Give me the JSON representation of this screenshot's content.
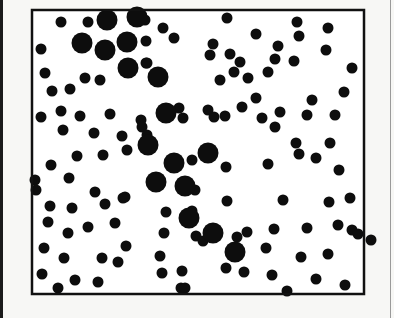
{
  "figure": {
    "frame": {
      "x": 32,
      "y": 10,
      "width": 332,
      "height": 284,
      "stroke": "#111111",
      "stroke_width": 2.5
    },
    "dot_color": "#0d0d0d",
    "background": "#ffffff",
    "small_radius": 5.5,
    "large_radius": 10.5,
    "small_dots": [
      [
        61,
        22
      ],
      [
        88,
        22
      ],
      [
        145,
        20
      ],
      [
        163,
        28
      ],
      [
        227,
        18
      ],
      [
        297,
        22
      ],
      [
        328,
        28
      ],
      [
        41,
        49
      ],
      [
        146,
        41
      ],
      [
        174,
        38
      ],
      [
        213,
        44
      ],
      [
        256,
        34
      ],
      [
        278,
        46
      ],
      [
        299,
        36
      ],
      [
        230,
        54
      ],
      [
        45,
        73
      ],
      [
        85,
        78
      ],
      [
        100,
        80
      ],
      [
        146,
        63
      ],
      [
        210,
        55
      ],
      [
        240,
        62
      ],
      [
        268,
        72
      ],
      [
        294,
        61
      ],
      [
        326,
        50
      ],
      [
        352,
        68
      ],
      [
        52,
        91
      ],
      [
        70,
        89
      ],
      [
        147,
        63
      ],
      [
        234,
        72
      ],
      [
        248,
        78
      ],
      [
        275,
        59
      ],
      [
        220,
        80
      ],
      [
        41,
        117
      ],
      [
        61,
        111
      ],
      [
        80,
        116
      ],
      [
        110,
        114
      ],
      [
        141,
        120
      ],
      [
        179,
        108
      ],
      [
        208,
        110
      ],
      [
        225,
        116
      ],
      [
        256,
        98
      ],
      [
        262,
        118
      ],
      [
        280,
        112
      ],
      [
        312,
        100
      ],
      [
        344,
        92
      ],
      [
        63,
        130
      ],
      [
        94,
        133
      ],
      [
        122,
        136
      ],
      [
        142,
        127
      ],
      [
        183,
        118
      ],
      [
        214,
        117
      ],
      [
        242,
        107
      ],
      [
        275,
        127
      ],
      [
        307,
        115
      ],
      [
        335,
        115
      ],
      [
        77,
        156
      ],
      [
        103,
        155
      ],
      [
        127,
        150
      ],
      [
        147,
        135
      ],
      [
        192,
        160
      ],
      [
        206,
        153
      ],
      [
        296,
        143
      ],
      [
        316,
        158
      ],
      [
        330,
        143
      ],
      [
        51,
        165
      ],
      [
        69,
        178
      ],
      [
        95,
        192
      ],
      [
        125,
        197
      ],
      [
        160,
        184
      ],
      [
        195,
        190
      ],
      [
        226,
        167
      ],
      [
        268,
        164
      ],
      [
        299,
        154
      ],
      [
        339,
        170
      ],
      [
        50,
        206
      ],
      [
        72,
        208
      ],
      [
        105,
        204
      ],
      [
        123,
        198
      ],
      [
        166,
        212
      ],
      [
        192,
        211
      ],
      [
        227,
        201
      ],
      [
        283,
        200
      ],
      [
        329,
        202
      ],
      [
        350,
        198
      ],
      [
        48,
        222
      ],
      [
        68,
        233
      ],
      [
        88,
        227
      ],
      [
        115,
        223
      ],
      [
        164,
        233
      ],
      [
        196,
        236
      ],
      [
        247,
        232
      ],
      [
        274,
        229
      ],
      [
        307,
        228
      ],
      [
        338,
        225
      ],
      [
        352,
        230
      ],
      [
        44,
        248
      ],
      [
        64,
        258
      ],
      [
        102,
        258
      ],
      [
        126,
        246
      ],
      [
        160,
        256
      ],
      [
        203,
        241
      ],
      [
        237,
        237
      ],
      [
        266,
        248
      ],
      [
        301,
        257
      ],
      [
        328,
        254
      ],
      [
        42,
        274
      ],
      [
        75,
        280
      ],
      [
        98,
        282
      ],
      [
        118,
        262
      ],
      [
        162,
        273
      ],
      [
        182,
        271
      ],
      [
        226,
        268
      ],
      [
        244,
        272
      ],
      [
        272,
        275
      ],
      [
        316,
        279
      ],
      [
        345,
        285
      ],
      [
        358,
        234
      ],
      [
        58,
        288
      ],
      [
        181,
        288
      ],
      [
        185,
        288
      ],
      [
        287,
        291
      ],
      [
        371,
        240
      ],
      [
        35,
        180
      ],
      [
        36,
        190
      ]
    ],
    "large_dots": [
      [
        107,
        20
      ],
      [
        137,
        17
      ],
      [
        82,
        43
      ],
      [
        105,
        50
      ],
      [
        127,
        42
      ],
      [
        128,
        68
      ],
      [
        158,
        77
      ],
      [
        166,
        113
      ],
      [
        148,
        145
      ],
      [
        208,
        153
      ],
      [
        174,
        163
      ],
      [
        156,
        182
      ],
      [
        185,
        186
      ],
      [
        189,
        218
      ],
      [
        213,
        233
      ],
      [
        235,
        252
      ]
    ]
  }
}
